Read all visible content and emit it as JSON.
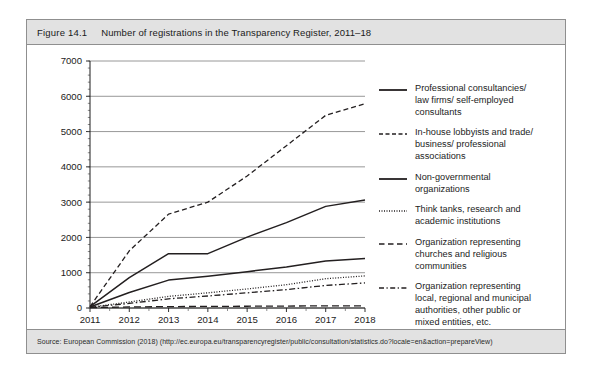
{
  "figure": {
    "number": "Figure 14.1",
    "title": "Number of registrations in the Transparency Register, 2011–18",
    "source": "Source: European Commission (2018) (http://ec.europa.eu/transparencyregister/public/consultation/statistics.do?locale=en&action=prepareView)"
  },
  "chart_data": {
    "type": "line",
    "title": "Number of registrations in the Transparency Register, 2011–18",
    "xlabel": "",
    "ylabel": "",
    "x": [
      "2011",
      "2012",
      "2013",
      "2014",
      "2015",
      "2016",
      "2017",
      "2018"
    ],
    "categories": [
      "2011",
      "2012",
      "2013",
      "2014",
      "2015",
      "2016",
      "2017",
      "2018"
    ],
    "ylim": [
      0,
      7000
    ],
    "yticks": [
      0,
      1000,
      2000,
      3000,
      4000,
      5000,
      6000,
      7000
    ],
    "ytick_labels": [
      "0",
      "1000",
      "2000",
      "3000",
      "4000",
      "5000",
      "6000",
      "7000"
    ],
    "grid": true,
    "legend_position": "right",
    "series": [
      {
        "name": "Professional consultancies/ law firms/ self-employed consultants",
        "style": "solid",
        "values": [
          40,
          860,
          1540,
          1540,
          2010,
          2420,
          2880,
          3060
        ]
      },
      {
        "name": "In-house lobbyists and trade/ business/ professional associations",
        "style": "dashed",
        "values": [
          40,
          1620,
          2660,
          3000,
          3740,
          4600,
          5460,
          5790
        ]
      },
      {
        "name": "Non-governmental organizations",
        "style": "solid",
        "values": [
          30,
          440,
          790,
          900,
          1030,
          1160,
          1330,
          1400
        ]
      },
      {
        "name": "Think tanks, research and academic institutions",
        "style": "dotted",
        "values": [
          20,
          170,
          330,
          430,
          540,
          660,
          830,
          910
        ]
      },
      {
        "name": "Organization representing churches and religious communities",
        "style": "longdash",
        "values": [
          10,
          30,
          40,
          45,
          50,
          55,
          60,
          62
        ]
      },
      {
        "name": "Organization representing local, regional and municipal authorities, other public or mixed entities, etc.",
        "style": "dashdot",
        "values": [
          20,
          130,
          260,
          340,
          430,
          520,
          640,
          710
        ]
      }
    ]
  },
  "legend": {
    "items": [
      {
        "label": "Professional consultancies/\nlaw firms/ self-employed\nconsultants",
        "sample": "solid-line-swatch"
      },
      {
        "label": "In-house lobbyists and trade/\nbusiness/ professional\nassociations",
        "sample": "dashed-line-swatch"
      },
      {
        "label": "Non-governmental\norganizations",
        "sample": "solid-line-swatch"
      },
      {
        "label": "Think tanks, research and\nacademic institutions",
        "sample": "dotted-line-swatch"
      },
      {
        "label": "Organization representing\nchurches and religious\ncommunities",
        "sample": "longdash-line-swatch"
      },
      {
        "label": "Organization representing\nlocal, regional and municipal\nauthorities, other public or\nmixed entities, etc.",
        "sample": "dashdot-line-swatch"
      }
    ]
  },
  "colors": {
    "line": "#231f20",
    "grid": "#8c8c8c",
    "header_bg": "#e2e2e2",
    "border": "#8f8f8f"
  }
}
